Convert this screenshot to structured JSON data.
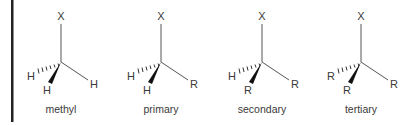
{
  "diagram": {
    "border_color": "#222222",
    "molecules": [
      {
        "name": "methyl",
        "label": "methyl",
        "top": "X",
        "hashed": "H",
        "wedge": "H",
        "right": "H"
      },
      {
        "name": "primary",
        "label": "primary",
        "top": "X",
        "hashed": "H",
        "wedge": "H",
        "right": "R"
      },
      {
        "name": "secondary",
        "label": "secondary",
        "top": "X",
        "hashed": "H",
        "wedge": "R",
        "right": "R"
      },
      {
        "name": "tertiary",
        "label": "tertiary",
        "top": "X",
        "hashed": "R",
        "wedge": "R",
        "right": "R"
      }
    ]
  }
}
